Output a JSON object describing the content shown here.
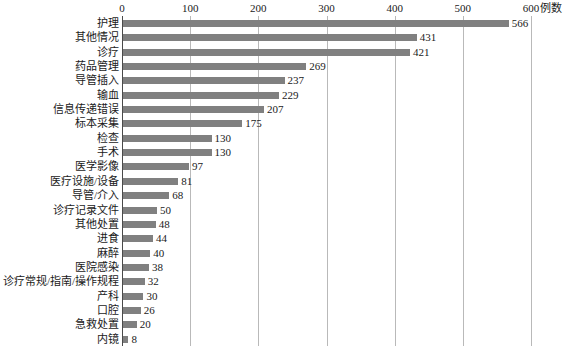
{
  "chart_data": {
    "type": "bar",
    "orientation": "horizontal",
    "title": "",
    "xlabel": "例数",
    "ylabel": "",
    "xlim": [
      0,
      600
    ],
    "xticks": [
      0,
      100,
      200,
      300,
      400,
      500,
      600
    ],
    "grid": true,
    "legend": false,
    "bar_color": "#808080",
    "categories": [
      "护理",
      "其他情况",
      "诊疗",
      "药品管理",
      "导管插入",
      "输血",
      "信息传递错误",
      "标本采集",
      "检查",
      "手术",
      "医学影像",
      "医疗设施/设备",
      "导管/介入",
      "诊疗记录文件",
      "其他处置",
      "进食",
      "麻醉",
      "医院感染",
      "诊疗常规/指南/操作规程",
      "产科",
      "口腔",
      "急救处置",
      "内镜"
    ],
    "values": [
      566,
      431,
      421,
      269,
      237,
      229,
      207,
      175,
      130,
      130,
      97,
      81,
      68,
      50,
      48,
      44,
      40,
      38,
      32,
      30,
      26,
      20,
      8
    ]
  }
}
